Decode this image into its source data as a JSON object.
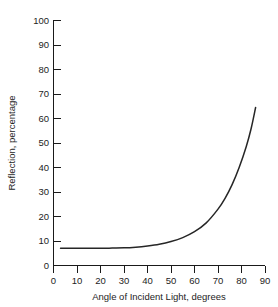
{
  "chart_data": {
    "type": "line",
    "title": "",
    "subtitle": "",
    "xlabel": "Angle of Incident Light, degrees",
    "ylabel": "Reflection, percentage",
    "xlim": [
      0,
      90
    ],
    "ylim": [
      0,
      100
    ],
    "xticks": [
      0,
      10,
      20,
      30,
      40,
      50,
      60,
      70,
      80,
      90
    ],
    "yticks": [
      0,
      10,
      20,
      30,
      40,
      50,
      60,
      70,
      80,
      90,
      100
    ],
    "xtick_labels": [
      "0",
      "10",
      "20",
      "30",
      "40",
      "50",
      "60",
      "70",
      "80",
      "90"
    ],
    "ytick_labels": [
      "0",
      "10",
      "20",
      "30",
      "40",
      "50",
      "60",
      "70",
      "80",
      "90",
      "100"
    ],
    "grid": false,
    "legend": false,
    "legend_position": "none",
    "annotations": [],
    "series": [
      {
        "name": "Reflection",
        "color": "#262626",
        "x": [
          3,
          5,
          10,
          15,
          20,
          25,
          30,
          35,
          40,
          45,
          50,
          55,
          60,
          65,
          70,
          73,
          76,
          79,
          82,
          84,
          86
        ],
        "y": [
          7.0,
          7.0,
          7.0,
          7.0,
          7.0,
          7.1,
          7.2,
          7.5,
          8.0,
          8.7,
          9.8,
          11.4,
          13.8,
          17.4,
          23.0,
          27.4,
          33.0,
          40.0,
          48.5,
          55.5,
          64.5
        ]
      }
    ]
  },
  "figure": {
    "background_color": "#ffffff",
    "axis_color": "#1a1a1a",
    "curve_color": "#262626"
  }
}
